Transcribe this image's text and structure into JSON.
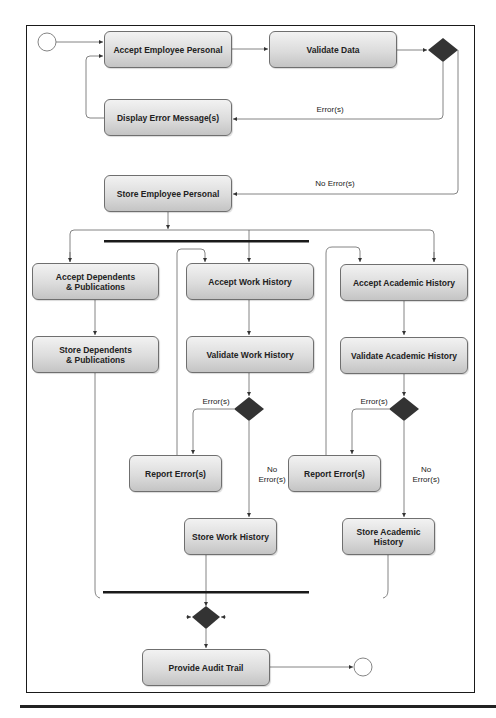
{
  "diagram": {
    "type": "UML activity diagram",
    "nodes": {
      "accept_employee_personal": "Accept Employee Personal",
      "validate_data": "Validate Data",
      "display_error_messages": "Display Error Message(s)",
      "store_employee_personal": "Store Employee Personal",
      "accept_dependents": "Accept Dependents\n& Publications",
      "store_dependents": "Store Dependents\n& Publications",
      "accept_work_history": "Accept Work History",
      "validate_work_history": "Validate Work History",
      "report_errors_work": "Report Error(s)",
      "store_work_history": "Store Work History",
      "accept_academic_history": "Accept Academic History",
      "validate_academic_history": "Validate Academic History",
      "report_errors_academic": "Report Error(s)",
      "store_academic_history": "Store Academic History",
      "provide_audit_trail": "Provide Audit Trail"
    },
    "labels": {
      "error_top": "Error(s)",
      "no_error_top": "No Error(s)",
      "error_work": "Error(s)",
      "no_error_work": "No\nError(s)",
      "error_academic": "Error(s)",
      "no_error_academic": "No\nError(s)"
    },
    "colors": {
      "line": "#555555",
      "decision": "#333333",
      "bar": "#1a1a1a",
      "node_border": "#6f6f6f"
    }
  }
}
